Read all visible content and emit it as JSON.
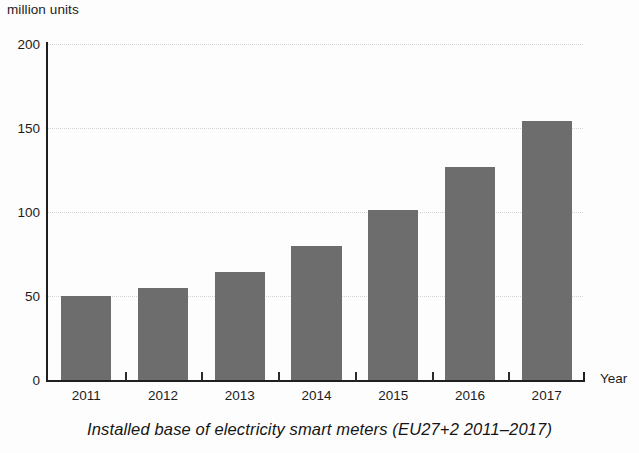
{
  "chart_data": {
    "type": "bar",
    "title": "",
    "caption": "Installed base of electricity smart meters (EU27+2  2011–2017)",
    "categories": [
      "2011",
      "2012",
      "2013",
      "2014",
      "2015",
      "2016",
      "2017"
    ],
    "values": [
      50,
      55,
      64,
      80,
      101,
      127,
      154
    ],
    "series": [
      {
        "name": "Installed base of electricity smart meters",
        "values": [
          50,
          55,
          64,
          80,
          101,
          127,
          154
        ]
      }
    ],
    "xlabel": "Year",
    "ylabel": "million units",
    "ylim": [
      0,
      200
    ],
    "yticks": [
      0,
      50,
      100,
      150,
      200
    ],
    "ytick_labels": [
      "0",
      "50",
      "100",
      "150",
      "200"
    ],
    "grid": true,
    "grid_axis": "y",
    "grid_style": "dotted",
    "legend": false,
    "bar_color": "#6d6d6d",
    "axis_color": "#1f1f1f",
    "grid_color": "#cfcfcf",
    "text_color": "#1c1c1c"
  }
}
